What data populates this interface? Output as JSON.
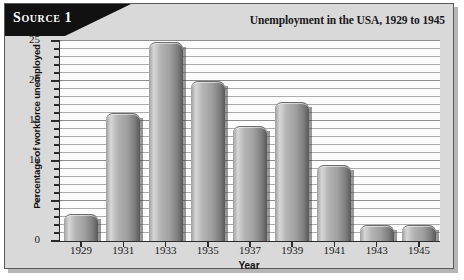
{
  "source_banner": {
    "label": "Source 1"
  },
  "chart_data": {
    "type": "bar",
    "title": "Unemployment in the USA, 1929 to 1945",
    "xlabel": "Year",
    "ylabel": "Percentage of workforce unemployed",
    "categories": [
      "1929",
      "1931",
      "1933",
      "1935",
      "1937",
      "1939",
      "1941",
      "1943",
      "1945"
    ],
    "values": [
      3.2,
      15.9,
      24.7,
      19.9,
      14.3,
      17.2,
      9.4,
      1.9,
      1.9
    ],
    "ylim": [
      0,
      25
    ],
    "ytick_labels": [
      "0",
      "5",
      "10",
      "15",
      "20",
      "25"
    ],
    "ytick_values": [
      0,
      5,
      10,
      15,
      20,
      25
    ],
    "ytick_minor_step": 1,
    "grid": true,
    "legend": "none",
    "series_color": "#a8a8a8"
  },
  "colors": {
    "panel_background": "#d9d9d9",
    "plot_background": "#fdfdfd",
    "axis": "#2b2b2b",
    "gridline": "#adadad",
    "banner": "#111111",
    "banner_text": "#ffffff"
  }
}
